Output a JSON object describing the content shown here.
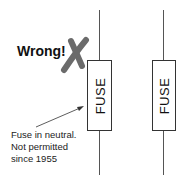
{
  "diagram": {
    "wrong_label": "Wrong!",
    "cross_mark_color": "#6b6b6b",
    "fuses": [
      {
        "label": "FUSE",
        "position": "left",
        "note": "neutral"
      },
      {
        "label": "FUSE",
        "position": "right",
        "note": "live"
      }
    ],
    "annotation": {
      "lines": [
        "Fuse in neutral.",
        "Not permitted",
        "since 1955"
      ]
    }
  }
}
